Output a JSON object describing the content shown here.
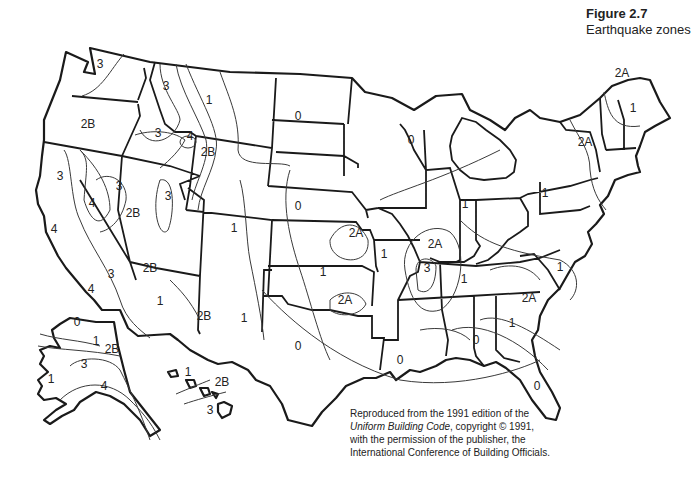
{
  "figure": {
    "number": "Figure 2.7",
    "title": "Earthquake zones"
  },
  "credit": {
    "line1": "Reproduced from the 1991 edition of the",
    "line2_italic": "Uniform Building Code",
    "line2_rest": ", copyright © 1991,",
    "line3": "with the permission of the publisher, the",
    "line4": "International Conference of Building Officials."
  },
  "zones": [
    {
      "label": "3",
      "x": 100,
      "y": 68,
      "region": "washington-west"
    },
    {
      "label": "2B",
      "x": 88,
      "y": 128,
      "region": "oregon"
    },
    {
      "label": "3",
      "x": 166,
      "y": 90,
      "region": "idaho-north"
    },
    {
      "label": "1",
      "x": 209,
      "y": 104,
      "region": "montana"
    },
    {
      "label": "3",
      "x": 158,
      "y": 137,
      "region": "idaho-south"
    },
    {
      "label": "4",
      "x": 190,
      "y": 140,
      "region": "yellowstone"
    },
    {
      "label": "2B",
      "x": 208,
      "y": 156,
      "region": "wyoming-west"
    },
    {
      "label": "3",
      "x": 60,
      "y": 180,
      "region": "california-north"
    },
    {
      "label": "3",
      "x": 119,
      "y": 190,
      "region": "nevada-west"
    },
    {
      "label": "4",
      "x": 92,
      "y": 207,
      "region": "nevada-west-inner"
    },
    {
      "label": "2B",
      "x": 133,
      "y": 217,
      "region": "nevada"
    },
    {
      "label": "3",
      "x": 168,
      "y": 200,
      "region": "utah"
    },
    {
      "label": "4",
      "x": 54,
      "y": 233,
      "region": "california-coast"
    },
    {
      "label": "1",
      "x": 234,
      "y": 232,
      "region": "colorado"
    },
    {
      "label": "3",
      "x": 111,
      "y": 278,
      "region": "california-south"
    },
    {
      "label": "4",
      "x": 91,
      "y": 293,
      "region": "california-southwest"
    },
    {
      "label": "2B",
      "x": 150,
      "y": 272,
      "region": "arizona-north"
    },
    {
      "label": "1",
      "x": 160,
      "y": 305,
      "region": "arizona"
    },
    {
      "label": "2B",
      "x": 204,
      "y": 320,
      "region": "new-mexico-west"
    },
    {
      "label": "1",
      "x": 244,
      "y": 322,
      "region": "new-mexico"
    },
    {
      "label": "0",
      "x": 298,
      "y": 120,
      "region": "north-dakota"
    },
    {
      "label": "0",
      "x": 298,
      "y": 210,
      "region": "nebraska"
    },
    {
      "label": "2A",
      "x": 356,
      "y": 237,
      "region": "kansas-east"
    },
    {
      "label": "1",
      "x": 323,
      "y": 276,
      "region": "oklahoma"
    },
    {
      "label": "2A",
      "x": 345,
      "y": 304,
      "region": "oklahoma-central"
    },
    {
      "label": "0",
      "x": 298,
      "y": 350,
      "region": "texas"
    },
    {
      "label": "0",
      "x": 411,
      "y": 144,
      "region": "wisconsin"
    },
    {
      "label": "1",
      "x": 384,
      "y": 258,
      "region": "missouri"
    },
    {
      "label": "2A",
      "x": 435,
      "y": 248,
      "region": "illinois-south"
    },
    {
      "label": "3",
      "x": 427,
      "y": 272,
      "region": "new-madrid"
    },
    {
      "label": "1",
      "x": 465,
      "y": 208,
      "region": "indiana"
    },
    {
      "label": "1",
      "x": 464,
      "y": 283,
      "region": "tennessee"
    },
    {
      "label": "0",
      "x": 400,
      "y": 364,
      "region": "louisiana"
    },
    {
      "label": "0",
      "x": 476,
      "y": 344,
      "region": "alabama"
    },
    {
      "label": "1",
      "x": 512,
      "y": 327,
      "region": "georgia"
    },
    {
      "label": "2A",
      "x": 529,
      "y": 302,
      "region": "south-carolina"
    },
    {
      "label": "1",
      "x": 560,
      "y": 271,
      "region": "north-carolina"
    },
    {
      "label": "0",
      "x": 537,
      "y": 390,
      "region": "florida"
    },
    {
      "label": "1",
      "x": 545,
      "y": 197,
      "region": "pennsylvania"
    },
    {
      "label": "2A",
      "x": 585,
      "y": 146,
      "region": "new-york"
    },
    {
      "label": "1",
      "x": 633,
      "y": 112,
      "region": "maine"
    },
    {
      "label": "2A",
      "x": 622,
      "y": 77,
      "region": "maine-north"
    },
    {
      "label": "0",
      "x": 77,
      "y": 326,
      "region": "alaska-north"
    },
    {
      "label": "1",
      "x": 96,
      "y": 345,
      "region": "alaska-central"
    },
    {
      "label": "2B",
      "x": 112,
      "y": 353,
      "region": "alaska-east"
    },
    {
      "label": "3",
      "x": 84,
      "y": 368,
      "region": "alaska-south"
    },
    {
      "label": "1",
      "x": 51,
      "y": 383,
      "region": "alaska-west"
    },
    {
      "label": "4",
      "x": 104,
      "y": 390,
      "region": "alaska-coast"
    },
    {
      "label": "1",
      "x": 188,
      "y": 376,
      "region": "hawaii-west"
    },
    {
      "label": "2B",
      "x": 222,
      "y": 386,
      "region": "hawaii-central"
    },
    {
      "label": "3",
      "x": 210,
      "y": 414,
      "region": "hawaii-big-island"
    }
  ]
}
